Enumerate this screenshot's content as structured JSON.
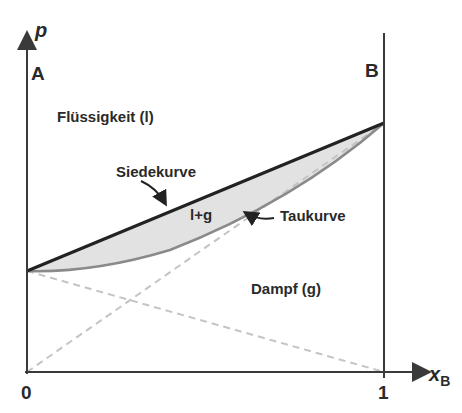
{
  "diagram": {
    "type": "phase-diagram",
    "axes": {
      "y_label": "p",
      "x_label": "x",
      "x_label_subscript": "B",
      "x_tick_0": "0",
      "x_tick_1": "1"
    },
    "components": {
      "left": "A",
      "right": "B"
    },
    "regions": {
      "liquid": "Flüssigkeit (l)",
      "two_phase": "l+g",
      "vapor": "Dampf (g)"
    },
    "curves": {
      "boiling": "Siedekurve",
      "dew": "Taukurve"
    },
    "colors": {
      "axis": "#3a3a3a",
      "boiling_curve": "#222222",
      "dew_curve": "#8a8a8a",
      "two_phase_fill": "#e2e2e2",
      "dashed": "#c4c4c4",
      "text": "#2a2a2a"
    }
  }
}
